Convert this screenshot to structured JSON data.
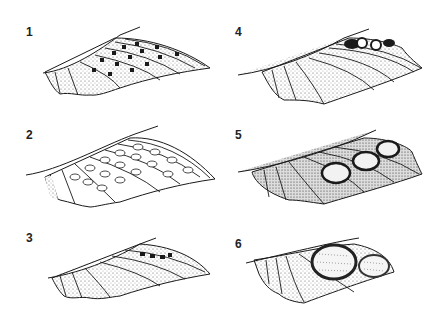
{
  "figure": {
    "colors": {
      "ink": "#1a1a1a",
      "paper": "#ffffff",
      "stipple": "#555555"
    },
    "panels": [
      {
        "id": 1,
        "label": "1",
        "pattern": "checkered bands"
      },
      {
        "id": 2,
        "label": "2",
        "pattern": "rows of pale ovals"
      },
      {
        "id": 3,
        "label": "3",
        "pattern": "small dark spots near tip"
      },
      {
        "id": 4,
        "label": "4",
        "pattern": "ringed spots near tip"
      },
      {
        "id": 5,
        "label": "5",
        "pattern": "three ocelli"
      },
      {
        "id": 6,
        "label": "6",
        "pattern": "two large ocelli"
      }
    ]
  }
}
